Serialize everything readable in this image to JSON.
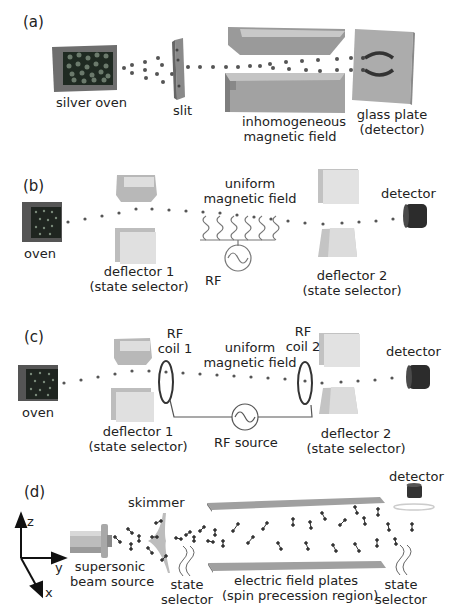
{
  "panels": {
    "a": {
      "label": "(a)",
      "silver_oven": "silver oven",
      "slit": "slit",
      "magnet_line1": "inhomogeneous",
      "magnet_line2": "magnetic field",
      "plate_line1": "glass plate",
      "plate_line2": "(detector)"
    },
    "b": {
      "label": "(b)",
      "oven": "oven",
      "field_line1": "uniform",
      "field_line2": "magnetic field",
      "detector": "detector",
      "deflector1_line1": "deflector 1",
      "deflector1_line2": "(state selector)",
      "rf": "RF",
      "deflector2_line1": "deflector 2",
      "deflector2_line2": "(state selector)"
    },
    "c": {
      "label": "(c)",
      "oven": "oven",
      "coil1_line1": "RF",
      "coil1_line2": "coil 1",
      "field_line1": "uniform",
      "field_line2": "magnetic field",
      "coil2_line1": "RF",
      "coil2_line2": "coil 2",
      "detector": "detector",
      "deflector1_line1": "deflector 1",
      "deflector1_line2": "(state selector)",
      "rf_source": "RF source",
      "deflector2_line1": "deflector 2",
      "deflector2_line2": "(state selector)"
    },
    "d": {
      "label": "(d)",
      "axis_z": "z",
      "axis_y": "y",
      "axis_x": "x",
      "skimmer": "skimmer",
      "source_line1": "supersonic",
      "source_line2": "beam source",
      "selector1_line1": "state",
      "selector1_line2": "selector",
      "plates_line1": "electric field plates",
      "plates_line2": "(spin precession region)",
      "selector2_line1": "state",
      "selector2_line2": "selector",
      "detector": "detector"
    }
  },
  "colors": {
    "text": "#222222",
    "dots": "#555555",
    "oven_dark": "#1e2420",
    "oven_frame": "#6a6a6a",
    "magnet": "#a8a8a8",
    "plate": "#b0b0b0",
    "detector": "#2a2a2a"
  }
}
